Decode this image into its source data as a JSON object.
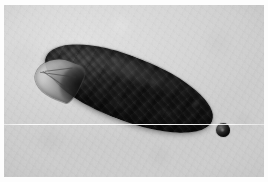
{
  "figure": {
    "domain": "photomicrograph",
    "title": "Dark elongate insect specimen on pale substrate",
    "medium": "grayscale photograph",
    "width_px": 268,
    "height_px": 182,
    "orientation": "long axis runs from upper-left to lower-right at roughly 21 degrees"
  },
  "plate": {
    "border_color": "#fdfdfd",
    "border_width_px": 4
  },
  "background": {
    "label": "pale grey granular substrate",
    "base_color": "#dcdcdc",
    "highlight_color": "#e6e6e6",
    "shadow_color": "#d2d2d2",
    "texture": "fine film grain with faint mottling"
  },
  "specimen": {
    "label": "elongate dark-bodied specimen",
    "body": {
      "label": "body",
      "fill_color": "#111111",
      "highlight_color": "#4a4a4a",
      "rim_color": "#b9b9b9",
      "shape": "elongate capsule, rounded posterior, tapered anterior",
      "rotation_deg": 21,
      "texture": "coarse granular mottling with faint transverse segmentation"
    },
    "head": {
      "label": "translucent pointed anterior head capsule",
      "fill_color": "#c4c4c4",
      "highlight_color": "#e2e2e2",
      "shadow_color": "#2a2a2a",
      "features": "three faint converging cuticular ridges, dark interior core"
    },
    "shadow": {
      "label": "soft cast shadow",
      "color": "#5a5a5a"
    }
  },
  "particle": {
    "label": "small detached rounded object at posterior",
    "fill_color": "#1b1b1b",
    "highlight_color": "#6a6a6a",
    "diameter_px": 14,
    "position": "just beyond the posterior tip, lower right"
  },
  "artifacts": {
    "scan_line": {
      "label": "horizontal white scan-line artifact",
      "color": "#ffffff",
      "y_px": 124,
      "spans": "full image width"
    },
    "vignette": {
      "label": "corner tonal falloff",
      "color": "#000000"
    }
  }
}
